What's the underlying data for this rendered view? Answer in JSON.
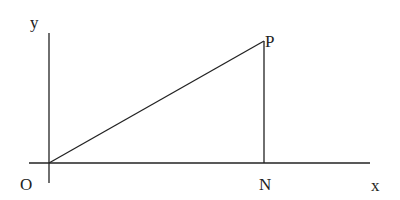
{
  "diagram": {
    "labels": {
      "y_axis": "y",
      "x_axis": "x",
      "origin": "O",
      "point_p": "P",
      "point_n": "N"
    },
    "colors": {
      "line": "#222222",
      "background": "#ffffff"
    },
    "geometry": {
      "origin": [
        49,
        163
      ],
      "P": [
        264,
        41
      ],
      "N": [
        264,
        163
      ]
    }
  }
}
